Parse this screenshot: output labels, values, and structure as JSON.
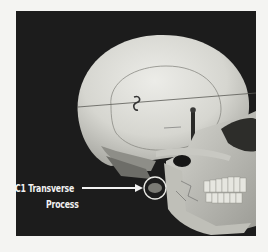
{
  "figure": {
    "annotation": {
      "label_line1": "C1 Transverse",
      "label_line2": "Process",
      "pointer": "arrow",
      "highlight": "circle"
    },
    "colors": {
      "background": "#1c1c1c",
      "page": "#f4f4f2",
      "bone": "#dcdcd6",
      "annotation": "#f2f2f2"
    }
  }
}
